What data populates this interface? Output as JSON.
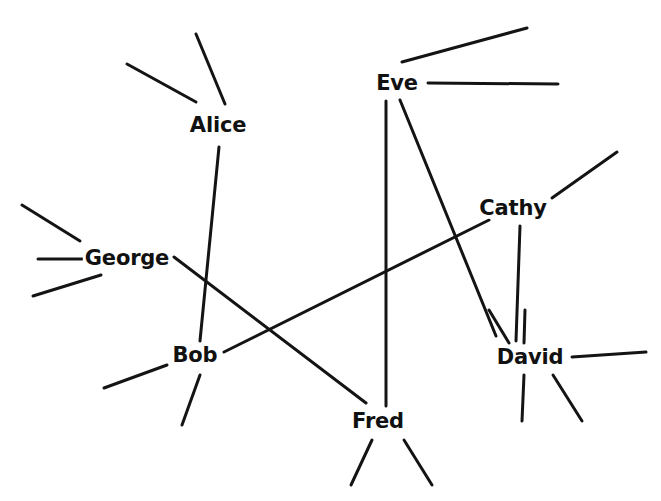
{
  "diagram": {
    "type": "node-link-network-graph",
    "title": "",
    "background_color": "#ffffff",
    "edge_color": "#141414",
    "label_color": "#111111",
    "edge_width": 3,
    "width": 661,
    "height": 501,
    "nodes": [
      {
        "id": "alice",
        "label": "Alice",
        "x": 218,
        "y": 125
      },
      {
        "id": "eve",
        "label": "Eve",
        "x": 397,
        "y": 83
      },
      {
        "id": "cathy",
        "label": "Cathy",
        "x": 513,
        "y": 208
      },
      {
        "id": "george",
        "label": "George",
        "x": 127,
        "y": 258
      },
      {
        "id": "bob",
        "label": "Bob",
        "x": 195,
        "y": 355
      },
      {
        "id": "david",
        "label": "David",
        "x": 530,
        "y": 357
      },
      {
        "id": "fred",
        "label": "Fred",
        "x": 378,
        "y": 421
      }
    ],
    "edges": [
      {
        "id": "alice-bob",
        "source": "alice",
        "target": "bob",
        "x1": 219,
        "y1": 147,
        "x2": 200,
        "y2": 341
      },
      {
        "id": "eve-fred",
        "source": "eve",
        "target": "fred",
        "x1": 386,
        "y1": 101,
        "x2": 386,
        "y2": 406
      },
      {
        "id": "eve-david",
        "source": "eve",
        "target": "david",
        "x1": 400,
        "y1": 100,
        "x2": 496,
        "y2": 336
      },
      {
        "id": "bob-cathy",
        "source": "bob",
        "target": "cathy",
        "x1": 224,
        "y1": 352,
        "x2": 489,
        "y2": 220
      },
      {
        "id": "george-fred",
        "source": "george",
        "target": "fred",
        "x1": 174,
        "y1": 257,
        "x2": 366,
        "y2": 403
      },
      {
        "id": "cathy-david",
        "source": "cathy",
        "target": "david",
        "x1": 520,
        "y1": 226,
        "x2": 516,
        "y2": 341
      }
    ],
    "stub_edges": [
      {
        "id": "alice-stub-upper-left",
        "node": "alice",
        "x1": 127,
        "y1": 64,
        "x2": 196,
        "y2": 102
      },
      {
        "id": "alice-stub-upper-right",
        "node": "alice",
        "x1": 196,
        "y1": 34,
        "x2": 225,
        "y2": 104
      },
      {
        "id": "eve-stub-upper-right",
        "node": "eve",
        "x1": 402,
        "y1": 62,
        "x2": 527,
        "y2": 28
      },
      {
        "id": "eve-stub-right",
        "node": "eve",
        "x1": 428,
        "y1": 83,
        "x2": 558,
        "y2": 84
      },
      {
        "id": "cathy-stub-upper-right",
        "node": "cathy",
        "x1": 552,
        "y1": 198,
        "x2": 617,
        "y2": 152
      },
      {
        "id": "george-stub-upper-left",
        "node": "george",
        "x1": 22,
        "y1": 205,
        "x2": 80,
        "y2": 241
      },
      {
        "id": "george-stub-left",
        "node": "george",
        "x1": 38,
        "y1": 259,
        "x2": 90,
        "y2": 259
      },
      {
        "id": "george-stub-lower-left",
        "node": "george",
        "x1": 33,
        "y1": 296,
        "x2": 101,
        "y2": 275
      },
      {
        "id": "bob-stub-lower-left",
        "node": "bob",
        "x1": 104,
        "y1": 388,
        "x2": 167,
        "y2": 365
      },
      {
        "id": "bob-stub-lower",
        "node": "bob",
        "x1": 200,
        "y1": 375,
        "x2": 182,
        "y2": 425
      },
      {
        "id": "david-stub-upper-left",
        "node": "david",
        "x1": 489,
        "y1": 310,
        "x2": 509,
        "y2": 343
      },
      {
        "id": "david-stub-upper",
        "node": "david",
        "x1": 525,
        "y1": 310,
        "x2": 524,
        "y2": 343
      },
      {
        "id": "david-stub-right",
        "node": "david",
        "x1": 572,
        "y1": 357,
        "x2": 646,
        "y2": 352
      },
      {
        "id": "david-stub-lower",
        "node": "david",
        "x1": 524,
        "y1": 375,
        "x2": 522,
        "y2": 421
      },
      {
        "id": "david-stub-lower-right",
        "node": "david",
        "x1": 553,
        "y1": 375,
        "x2": 582,
        "y2": 421
      },
      {
        "id": "fred-stub-lower-left",
        "node": "fred",
        "x1": 372,
        "y1": 440,
        "x2": 351,
        "y2": 485
      },
      {
        "id": "fred-stub-lower-right",
        "node": "fred",
        "x1": 404,
        "y1": 440,
        "x2": 432,
        "y2": 485
      }
    ]
  }
}
